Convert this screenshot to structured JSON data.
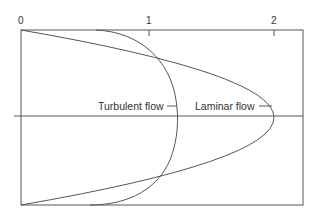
{
  "diagram": {
    "type": "velocity-profile",
    "axis": {
      "ticks": [
        {
          "label": "0",
          "value": 0
        },
        {
          "label": "1",
          "value": 1
        },
        {
          "label": "2",
          "value": 2
        }
      ]
    },
    "curves": [
      {
        "name": "turbulent",
        "label": "Turbulent flow",
        "peak_value": 1.2,
        "shape": "blunt"
      },
      {
        "name": "laminar",
        "label": "Laminar flow",
        "peak_value": 2.0,
        "shape": "parabolic"
      }
    ],
    "colors": {
      "line": "#555555",
      "text": "#333333",
      "background": "#ffffff"
    }
  }
}
